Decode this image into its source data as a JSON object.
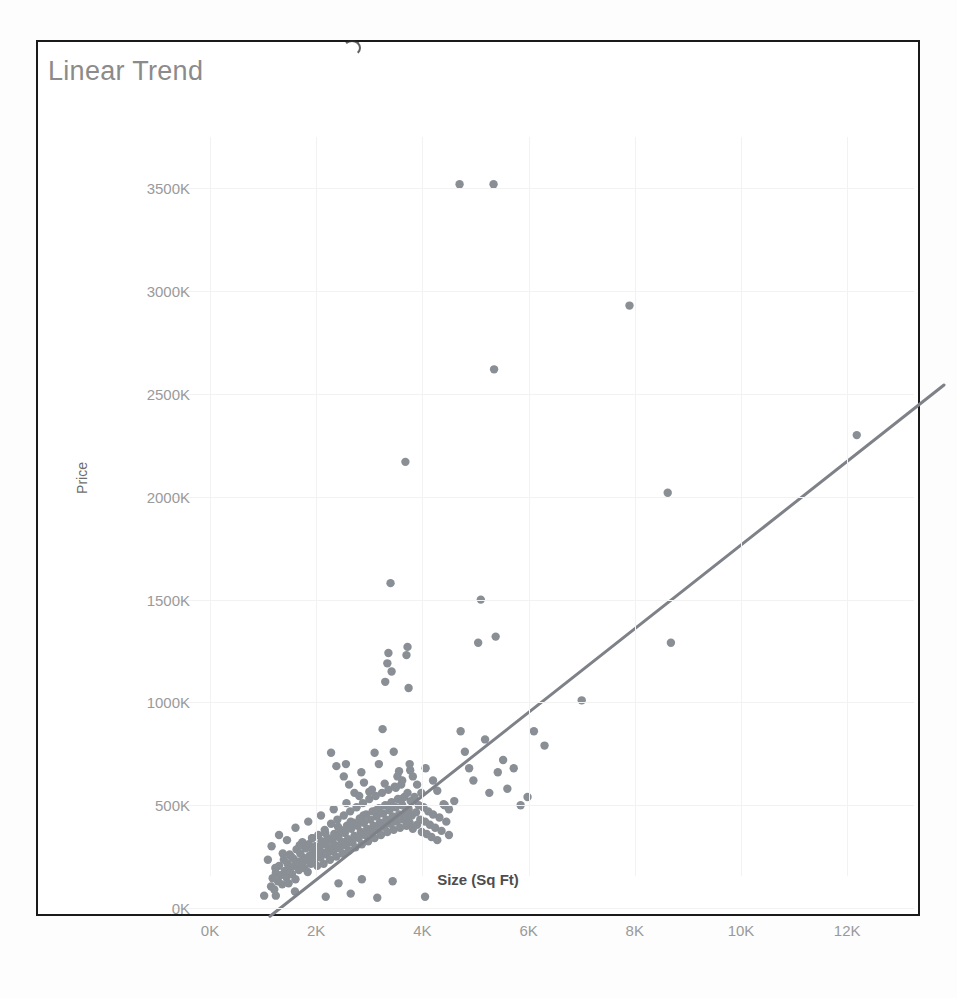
{
  "chart_title": "Linear Trend",
  "axes": {
    "y_label": "Price",
    "x_label": "Size (Sq Ft)",
    "y_ticks": [
      "0K",
      "500K",
      "1000K",
      "1500K",
      "2000K",
      "2500K",
      "3000K",
      "3500K"
    ],
    "x_ticks": [
      "0K",
      "2K",
      "4K",
      "6K",
      "8K",
      "10K",
      "12K"
    ]
  },
  "colors": {
    "point": "#8a8f96",
    "trend_line": "#7e8288",
    "title_text": "#8b8b8b",
    "tick_text": "#9a9a9a",
    "frame_border": "#1a1a1a",
    "gridline": "#f2f2f2"
  },
  "chart_data": {
    "type": "scatter",
    "title": "Linear Trend",
    "xlabel": "Size (Sq Ft)",
    "ylabel": "Price",
    "xlim": [
      0,
      13400
    ],
    "ylim": [
      0,
      3750
    ],
    "x_tick_values": [
      0,
      2000,
      4000,
      6000,
      8000,
      10000,
      12000
    ],
    "y_tick_values": [
      0,
      500,
      1000,
      1500,
      2000,
      2500,
      3000,
      3500
    ],
    "y_unit": "K",
    "grid": true,
    "legend": null,
    "series": [
      {
        "name": "Price vs Size",
        "marker": "circle",
        "color": "#8a8f96",
        "points": [
          [
            1020,
            60
          ],
          [
            1150,
            105
          ],
          [
            1180,
            145
          ],
          [
            1210,
            90
          ],
          [
            1240,
            170
          ],
          [
            1280,
            130
          ],
          [
            1300,
            205
          ],
          [
            1330,
            160
          ],
          [
            1360,
            115
          ],
          [
            1390,
            235
          ],
          [
            1410,
            180
          ],
          [
            1440,
            150
          ],
          [
            1460,
            215
          ],
          [
            1480,
            120
          ],
          [
            1500,
            260
          ],
          [
            1520,
            195
          ],
          [
            1545,
            165
          ],
          [
            1570,
            240
          ],
          [
            1590,
            205
          ],
          [
            1610,
            140
          ],
          [
            1630,
            285
          ],
          [
            1650,
            225
          ],
          [
            1675,
            185
          ],
          [
            1700,
            265
          ],
          [
            1720,
            210
          ],
          [
            1740,
            320
          ],
          [
            1760,
            245
          ],
          [
            1780,
            195
          ],
          [
            1800,
            290
          ],
          [
            1820,
            235
          ],
          [
            1840,
            175
          ],
          [
            1860,
            310
          ],
          [
            1880,
            255
          ],
          [
            1900,
            215
          ],
          [
            1920,
            340
          ],
          [
            1940,
            280
          ],
          [
            1960,
            230
          ],
          [
            1980,
            300
          ],
          [
            2000,
            260
          ],
          [
            2020,
            205
          ],
          [
            2040,
            355
          ],
          [
            2060,
            295
          ],
          [
            2080,
            245
          ],
          [
            2100,
            325
          ],
          [
            2120,
            270
          ],
          [
            2140,
            215
          ],
          [
            2160,
            380
          ],
          [
            2180,
            310
          ],
          [
            2200,
            260
          ],
          [
            2220,
            340
          ],
          [
            2240,
            290
          ],
          [
            2260,
            235
          ],
          [
            2280,
            410
          ],
          [
            2300,
            330
          ],
          [
            2320,
            275
          ],
          [
            2340,
            360
          ],
          [
            2360,
            305
          ],
          [
            2380,
            250
          ],
          [
            2400,
            430
          ],
          [
            2420,
            345
          ],
          [
            2440,
            290
          ],
          [
            2460,
            380
          ],
          [
            2480,
            320
          ],
          [
            2500,
            265
          ],
          [
            2520,
            450
          ],
          [
            2540,
            365
          ],
          [
            2560,
            305
          ],
          [
            2580,
            400
          ],
          [
            2600,
            335
          ],
          [
            2620,
            280
          ],
          [
            2640,
            470
          ],
          [
            2660,
            385
          ],
          [
            2680,
            320
          ],
          [
            2700,
            415
          ],
          [
            2720,
            350
          ],
          [
            2740,
            295
          ],
          [
            2760,
            490
          ],
          [
            2780,
            400
          ],
          [
            2800,
            340
          ],
          [
            2820,
            435
          ],
          [
            2840,
            370
          ],
          [
            2860,
            310
          ],
          [
            2880,
            510
          ],
          [
            2900,
            415
          ],
          [
            2920,
            355
          ],
          [
            2940,
            455
          ],
          [
            2960,
            385
          ],
          [
            2980,
            325
          ],
          [
            3000,
            530
          ],
          [
            3020,
            430
          ],
          [
            3040,
            370
          ],
          [
            3060,
            470
          ],
          [
            3080,
            400
          ],
          [
            3100,
            340
          ],
          [
            3120,
            545
          ],
          [
            3140,
            445
          ],
          [
            3160,
            385
          ],
          [
            3180,
            485
          ],
          [
            3200,
            415
          ],
          [
            3220,
            355
          ],
          [
            3240,
            560
          ],
          [
            3260,
            460
          ],
          [
            3280,
            395
          ],
          [
            3300,
            500
          ],
          [
            3320,
            430
          ],
          [
            3340,
            370
          ],
          [
            3360,
            575
          ],
          [
            3380,
            475
          ],
          [
            3400,
            410
          ],
          [
            3420,
            515
          ],
          [
            3440,
            445
          ],
          [
            3460,
            380
          ],
          [
            3480,
            590
          ],
          [
            3500,
            490
          ],
          [
            3520,
            420
          ],
          [
            3540,
            530
          ],
          [
            3560,
            455
          ],
          [
            3580,
            390
          ],
          [
            3600,
            600
          ],
          [
            3620,
            500
          ],
          [
            3640,
            430
          ],
          [
            3660,
            540
          ],
          [
            3680,
            465
          ],
          [
            3700,
            400
          ],
          [
            3720,
            560
          ],
          [
            3740,
            480
          ],
          [
            3760,
            415
          ],
          [
            3780,
            520
          ],
          [
            3800,
            450
          ],
          [
            3820,
            385
          ],
          [
            3850,
            540
          ],
          [
            3880,
            465
          ],
          [
            3900,
            405
          ],
          [
            3930,
            500
          ],
          [
            3960,
            430
          ],
          [
            3990,
            370
          ],
          [
            4020,
            490
          ],
          [
            4050,
            420
          ],
          [
            4080,
            360
          ],
          [
            4110,
            470
          ],
          [
            4140,
            405
          ],
          [
            4170,
            345
          ],
          [
            4200,
            455
          ],
          [
            4240,
            390
          ],
          [
            4280,
            330
          ],
          [
            4320,
            440
          ],
          [
            4360,
            375
          ],
          [
            4400,
            505
          ],
          [
            4450,
            420
          ],
          [
            4500,
            355
          ],
          [
            1090,
            235
          ],
          [
            1160,
            300
          ],
          [
            1230,
            195
          ],
          [
            1300,
            355
          ],
          [
            1370,
            265
          ],
          [
            1450,
            330
          ],
          [
            1530,
            250
          ],
          [
            1610,
            390
          ],
          [
            1690,
            305
          ],
          [
            1770,
            230
          ],
          [
            1850,
            420
          ],
          [
            1930,
            340
          ],
          [
            2010,
            275
          ],
          [
            2090,
            450
          ],
          [
            2170,
            365
          ],
          [
            2250,
            295
          ],
          [
            2330,
            480
          ],
          [
            2410,
            395
          ],
          [
            2490,
            320
          ],
          [
            2570,
            510
          ],
          [
            2650,
            420
          ],
          [
            2730,
            345
          ],
          [
            2810,
            545
          ],
          [
            2890,
            450
          ],
          [
            2970,
            370
          ],
          [
            3050,
            575
          ],
          [
            3130,
            475
          ],
          [
            3210,
            395
          ],
          [
            3290,
            605
          ],
          [
            3370,
            500
          ],
          [
            3450,
            420
          ],
          [
            3530,
            640
          ],
          [
            3610,
            530
          ],
          [
            3690,
            445
          ],
          [
            3770,
            670
          ],
          [
            1240,
            60
          ],
          [
            1600,
            80
          ],
          [
            2180,
            55
          ],
          [
            2650,
            70
          ],
          [
            3150,
            50
          ],
          [
            4050,
            55
          ],
          [
            2420,
            120
          ],
          [
            2860,
            140
          ],
          [
            3440,
            130
          ],
          [
            2280,
            755
          ],
          [
            2380,
            690
          ],
          [
            2520,
            640
          ],
          [
            2560,
            700
          ],
          [
            2620,
            600
          ],
          [
            2720,
            560
          ],
          [
            2850,
            660
          ],
          [
            2900,
            610
          ],
          [
            3000,
            565
          ],
          [
            3100,
            755
          ],
          [
            3180,
            700
          ],
          [
            3250,
            870
          ],
          [
            3300,
            1100
          ],
          [
            3340,
            1190
          ],
          [
            3360,
            1240
          ],
          [
            3400,
            1580
          ],
          [
            3420,
            1150
          ],
          [
            3460,
            760
          ],
          [
            3500,
            585
          ],
          [
            3560,
            665
          ],
          [
            3620,
            620
          ],
          [
            3680,
            2170
          ],
          [
            3700,
            1230
          ],
          [
            3720,
            1270
          ],
          [
            3740,
            1070
          ],
          [
            3760,
            700
          ],
          [
            3820,
            640
          ],
          [
            3900,
            600
          ],
          [
            3980,
            560
          ],
          [
            4060,
            680
          ],
          [
            4200,
            620
          ],
          [
            4280,
            570
          ],
          [
            4420,
            500
          ],
          [
            4500,
            480
          ],
          [
            4600,
            520
          ],
          [
            4700,
            3520
          ],
          [
            4720,
            860
          ],
          [
            4800,
            760
          ],
          [
            4880,
            680
          ],
          [
            4960,
            620
          ],
          [
            5050,
            1290
          ],
          [
            5100,
            1500
          ],
          [
            5180,
            820
          ],
          [
            5260,
            560
          ],
          [
            5340,
            3520
          ],
          [
            5350,
            2620
          ],
          [
            5380,
            1320
          ],
          [
            5420,
            660
          ],
          [
            5520,
            720
          ],
          [
            5600,
            580
          ],
          [
            5720,
            680
          ],
          [
            5850,
            500
          ],
          [
            5980,
            540
          ],
          [
            6100,
            860
          ],
          [
            6300,
            790
          ],
          [
            7000,
            1010
          ],
          [
            7900,
            2930
          ],
          [
            8620,
            2020
          ],
          [
            8680,
            1290
          ],
          [
            12180,
            2300
          ]
        ]
      }
    ],
    "trend_line": {
      "label": "Linear Trend",
      "color": "#7e8288",
      "x_start": 1130,
      "y_start": -40,
      "x_end": 13830,
      "y_end": 2545
    }
  }
}
